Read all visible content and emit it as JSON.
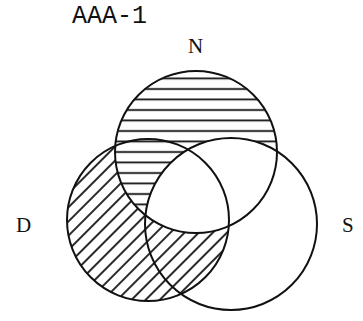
{
  "title": "AAA-1",
  "sets": {
    "N": {
      "label": "N",
      "cx": 196,
      "cy": 152,
      "r": 81
    },
    "D": {
      "label": "D",
      "cx": 148,
      "cy": 220,
      "r": 81
    },
    "S": {
      "label": "S",
      "cx": 231,
      "cy": 224,
      "r": 86
    }
  },
  "shading": [
    {
      "region": "N minus S",
      "pattern": "horizontal-lines"
    },
    {
      "region": "D minus N",
      "pattern": "diagonal-lines"
    }
  ],
  "colors": {
    "stroke": "#111111",
    "background": "#ffffff"
  }
}
